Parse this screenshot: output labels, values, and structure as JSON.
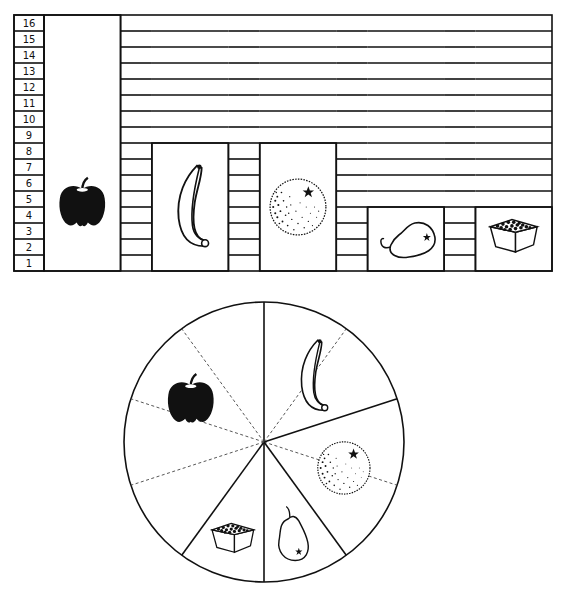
{
  "chart_data": [
    {
      "type": "bar",
      "title": "",
      "xlabel": "",
      "ylabel": "",
      "ylim": [
        0,
        16
      ],
      "y_ticks": [
        "1",
        "2",
        "3",
        "4",
        "5",
        "6",
        "7",
        "8",
        "9",
        "10",
        "11",
        "12",
        "13",
        "14",
        "15",
        "16"
      ],
      "categories": [
        "apple",
        "banana",
        "orange",
        "pear",
        "berries"
      ],
      "values": [
        16,
        8,
        8,
        4,
        4
      ],
      "bar_style": "pictograph",
      "grid": true
    },
    {
      "type": "pie",
      "title": "",
      "categories": [
        "banana",
        "orange",
        "pear",
        "berries",
        "apple"
      ],
      "values": [
        8,
        8,
        4,
        4,
        16
      ],
      "start": "top",
      "direction": "clockwise",
      "subdivision_dashed_lines": true,
      "label_style": "pictograph"
    }
  ]
}
